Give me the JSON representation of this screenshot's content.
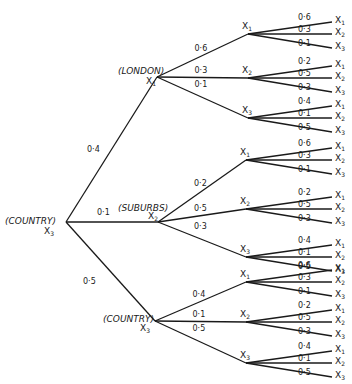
{
  "diagram": {
    "type": "probability-tree",
    "root": {
      "name": "COUNTRY",
      "state": "X3"
    },
    "level1": [
      {
        "name": "LONDON",
        "state": "X1",
        "prob": "0·4",
        "children": [
          {
            "state": "X1",
            "prob": "0·6",
            "leaves": [
              {
                "prob": "0·6",
                "state": "X1"
              },
              {
                "prob": "0·3",
                "state": "X2"
              },
              {
                "prob": "0·1",
                "state": "X3"
              }
            ]
          },
          {
            "state": "X2",
            "prob": "0·3",
            "leaves": [
              {
                "prob": "0·2",
                "state": "X1"
              },
              {
                "prob": "0·5",
                "state": "X2"
              },
              {
                "prob": "0·3",
                "state": "X3"
              }
            ]
          },
          {
            "state": "X3",
            "prob": "0·1",
            "leaves": [
              {
                "prob": "0·4",
                "state": "X1"
              },
              {
                "prob": "0·1",
                "state": "X2"
              },
              {
                "prob": "0·5",
                "state": "X3"
              }
            ]
          }
        ]
      },
      {
        "name": "SUBURBS",
        "state": "X2",
        "prob": "0·1",
        "children": [
          {
            "state": "X1",
            "prob": "0·2",
            "leaves": [
              {
                "prob": "0·6",
                "state": "X1"
              },
              {
                "prob": "0·3",
                "state": "X2"
              },
              {
                "prob": "0·1",
                "state": "X3"
              }
            ]
          },
          {
            "state": "X2",
            "prob": "0·5",
            "leaves": [
              {
                "prob": "0·2",
                "state": "X1"
              },
              {
                "prob": "0·5",
                "state": "X2"
              },
              {
                "prob": "0·3",
                "state": "X3"
              }
            ]
          },
          {
            "state": "X3",
            "prob": "0·3",
            "leaves": [
              {
                "prob": "0·4",
                "state": "X1"
              },
              {
                "prob": "0·1",
                "state": "X2"
              },
              {
                "prob": "0·5",
                "state": "X3"
              }
            ]
          }
        ]
      },
      {
        "name": "COUNTRY",
        "state": "X3",
        "prob": "0·5",
        "children": [
          {
            "state": "X1",
            "prob": "0·4",
            "leaves": [
              {
                "prob": "0·6",
                "state": "X1"
              },
              {
                "prob": "0·3",
                "state": "X2"
              },
              {
                "prob": "0·1",
                "state": "X3"
              }
            ]
          },
          {
            "state": "X2",
            "prob": "0·1",
            "leaves": [
              {
                "prob": "0·2",
                "state": "X1"
              },
              {
                "prob": "0·5",
                "state": "X2"
              },
              {
                "prob": "0·3",
                "state": "X3"
              }
            ]
          },
          {
            "state": "X3",
            "prob": "0·5",
            "leaves": [
              {
                "prob": "0·4",
                "state": "X1"
              },
              {
                "prob": "0·1",
                "state": "X2"
              },
              {
                "prob": "0·5",
                "state": "X3"
              }
            ]
          }
        ]
      }
    ]
  }
}
